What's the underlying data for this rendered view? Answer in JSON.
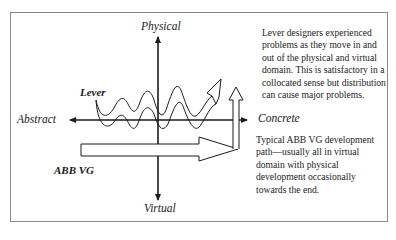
{
  "diagram": {
    "axes": {
      "top": "Physical",
      "bottom": "Virtual",
      "left": "Abstract",
      "right": "Concrete"
    },
    "series": [
      {
        "name": "Lever",
        "shape": "wavy-arrow",
        "path": "oscillates between physical and virtual, ending upward-right"
      },
      {
        "name": "ABB VG",
        "shape": "block-arrow",
        "path": "horizontal in virtual domain, then turns up toward physical at the end"
      }
    ],
    "annotations": {
      "lever_note": "Lever designers experienced problems as they move in and out of the physical and virtual domain. This is satisfactory in a collocated sense but distribution can cause major problems.",
      "abb_note": "Typical ABB VG development path—usually all in virtual domain with physical development occasionally towards the end."
    },
    "colors": {
      "stroke": "#1a1a1a",
      "frame": "#8a8a8a",
      "background": "#ffffff"
    }
  }
}
